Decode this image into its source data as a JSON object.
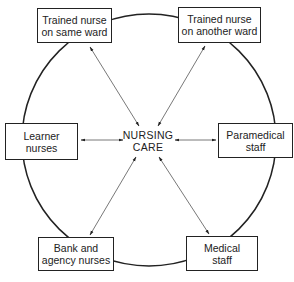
{
  "center": {
    "line1": "NURSING",
    "line2": "CARE"
  },
  "nodes": [
    {
      "id": "trained-same",
      "line1": "Trained nurse",
      "line2": "on same ward"
    },
    {
      "id": "trained-another",
      "line1": "Trained nurse",
      "line2": "on another ward"
    },
    {
      "id": "learner",
      "line1": "Learner",
      "line2": "nurses"
    },
    {
      "id": "paramedical",
      "line1": "Paramedical",
      "line2": "staff"
    },
    {
      "id": "bank",
      "line1": "Bank and",
      "line2": "agency nurses"
    },
    {
      "id": "medical",
      "line1": "Medical",
      "line2": "staff"
    }
  ]
}
